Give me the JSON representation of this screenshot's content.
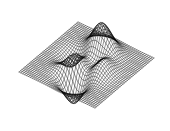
{
  "figure": {
    "kind": "wireframe-mesh-surface",
    "title": "",
    "background_color": "#ffffff",
    "line_color": "#000000",
    "width_px": 170,
    "height_px": 131,
    "has_axes": false,
    "has_labels": false,
    "has_legend": false,
    "has_colorbar": false,
    "has_text": false
  },
  "chart_data": {
    "type": "surface",
    "render_style": "wireframe-mesh",
    "title": "",
    "xlabel": "",
    "ylabel": "",
    "zlabel": "",
    "grid": false,
    "legend_position": "none",
    "x": [
      -3.0,
      -2.0,
      -1.0,
      0.0,
      1.0,
      2.0,
      3.0
    ],
    "y": [
      -3.0,
      -2.0,
      -1.0,
      0.0,
      1.0,
      2.0,
      3.0
    ],
    "xlim": [
      -3.0,
      3.0
    ],
    "ylim": [
      -3.0,
      3.0
    ],
    "zlim": [
      -6.5,
      8.1
    ],
    "function": "peaks",
    "formula": "z = 3*(1-x)^2*exp(-x^2-(y+1)^2) - 10*(x/5 - x^3 - y^5)*exp(-x^2-y^2) - (1/3)*exp(-(x+1)^2 - y^2)",
    "grid_resolution": {
      "nx": 41,
      "ny": 41
    },
    "view": {
      "azimuth_deg": -37.5,
      "elevation_deg": 30
    },
    "features": [
      {
        "name": "primary-peak",
        "x": -0.01,
        "y": 1.58,
        "z": 8.08,
        "screen_x": 97,
        "screen_y": 6
      },
      {
        "name": "primary-trough",
        "x": 0.23,
        "y": -1.63,
        "z": -6.55,
        "screen_x": 82,
        "screen_y": 118
      },
      {
        "name": "secondary-ridge",
        "x": -1.35,
        "y": 0.2,
        "z": 3.59,
        "screen_x": 55,
        "screen_y": 55
      },
      {
        "name": "secondary-dip",
        "x": 1.33,
        "y": -0.0,
        "z": -3.05,
        "screen_x": 118,
        "screen_y": 78
      }
    ],
    "z_values": [
      [
        0.0,
        0.0,
        -0.1,
        -0.2,
        -0.1,
        0.0,
        0.0
      ],
      [
        0.0,
        -0.2,
        -0.8,
        -1.1,
        -0.4,
        0.0,
        0.0
      ],
      [
        0.1,
        0.3,
        0.4,
        -1.2,
        -2.9,
        -0.6,
        0.0
      ],
      [
        0.2,
        1.2,
        3.4,
        0.8,
        -3.0,
        -0.9,
        -0.1
      ],
      [
        0.1,
        1.0,
        3.6,
        3.8,
        0.4,
        -0.3,
        0.0
      ],
      [
        0.0,
        0.2,
        1.1,
        2.2,
        0.9,
        0.1,
        0.0
      ],
      [
        0.0,
        0.0,
        0.1,
        0.2,
        0.1,
        0.0,
        0.0
      ]
    ],
    "surface_corners_screen": [
      {
        "name": "left",
        "x": 19,
        "y": 72
      },
      {
        "name": "top",
        "x": 78,
        "y": 22
      },
      {
        "name": "right",
        "x": 155,
        "y": 57
      },
      {
        "name": "bottom",
        "x": 95,
        "y": 108
      }
    ]
  }
}
